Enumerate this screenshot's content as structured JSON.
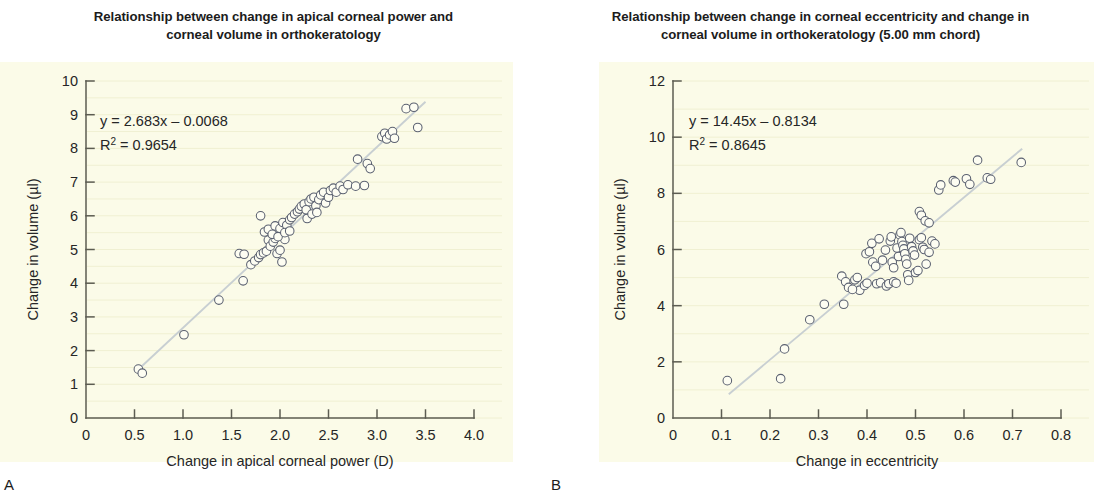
{
  "figure": {
    "panels": [
      {
        "letter": "A",
        "title_line1": "Relationship between change in apical corneal power and",
        "title_line2": "corneal volume in orthokeratology",
        "equation": "y = 2.683x – 0.0068",
        "r2_prefix": "R",
        "r2_sup": "2",
        "r2_value": " = 0.9654"
      },
      {
        "letter": "B",
        "title_line1": "Relationship between change in corneal eccentricity and change in",
        "title_line2": "corneal volume in orthokeratology (5.00 mm chord)",
        "equation": "y = 14.45x – 0.8134",
        "r2_prefix": "R",
        "r2_sup": "2",
        "r2_value": " = 0.8645"
      }
    ],
    "colors": {
      "panel_background": "#fbfbe8",
      "page_background": "#ffffff",
      "marker_stroke": "#5a6070",
      "marker_fill": "#fdfdf2",
      "trendline": "#c8cfd2",
      "axis": "#5c5c52",
      "gridline": "#f0f0d2",
      "text": "#262626"
    }
  },
  "chart_data": [
    {
      "type": "scatter",
      "panel": "A",
      "title": "Relationship between change in apical corneal power and corneal volume in orthokeratology",
      "xlabel": "Change in apical corneal power (D)",
      "ylabel": "Change in volume (µl)",
      "xlim": [
        0,
        4.0
      ],
      "ylim": [
        0,
        10
      ],
      "xticks": [
        "0",
        "0.5",
        "1.0",
        "1.5",
        "2.0",
        "2.5",
        "3.0",
        "3.5",
        "4.0"
      ],
      "xtick_values": [
        0,
        0.5,
        1.0,
        1.5,
        2.0,
        2.5,
        3.0,
        3.5,
        4.0
      ],
      "yticks": [
        "0",
        "1",
        "2",
        "3",
        "4",
        "5",
        "6",
        "7",
        "8",
        "9",
        "10"
      ],
      "ytick_values": [
        0,
        1,
        2,
        3,
        4,
        5,
        6,
        7,
        8,
        9,
        10
      ],
      "grid": true,
      "legend": "none",
      "annotations": [
        "y = 2.683x – 0.0068",
        "R2 = 0.9654"
      ],
      "fit": {
        "slope": 2.683,
        "intercept": -0.0068,
        "r_squared": 0.9654
      },
      "fit_line_x_range": [
        0.52,
        3.5
      ],
      "points": [
        [
          0.54,
          1.45
        ],
        [
          0.58,
          1.33
        ],
        [
          1.01,
          2.47
        ],
        [
          1.37,
          3.5
        ],
        [
          1.62,
          4.07
        ],
        [
          1.58,
          4.88
        ],
        [
          1.63,
          4.86
        ],
        [
          1.7,
          4.55
        ],
        [
          1.74,
          4.66
        ],
        [
          1.78,
          4.76
        ],
        [
          1.8,
          4.85
        ],
        [
          1.83,
          4.9
        ],
        [
          1.86,
          4.95
        ],
        [
          1.88,
          5.28
        ],
        [
          1.9,
          5.1
        ],
        [
          1.93,
          5.22
        ],
        [
          1.95,
          5.33
        ],
        [
          1.97,
          4.88
        ],
        [
          2.0,
          4.98
        ],
        [
          2.02,
          4.63
        ],
        [
          2.05,
          5.3
        ],
        [
          1.84,
          5.52
        ],
        [
          1.88,
          5.6
        ],
        [
          1.95,
          5.7
        ],
        [
          2.0,
          5.62
        ],
        [
          2.03,
          5.8
        ],
        [
          2.07,
          5.72
        ],
        [
          2.1,
          5.88
        ],
        [
          2.12,
          5.95
        ],
        [
          1.92,
          5.45
        ],
        [
          1.98,
          5.38
        ],
        [
          2.05,
          5.5
        ],
        [
          2.1,
          5.55
        ],
        [
          1.8,
          6.0
        ],
        [
          2.15,
          6.05
        ],
        [
          2.18,
          6.12
        ],
        [
          2.2,
          6.2
        ],
        [
          2.22,
          6.28
        ],
        [
          2.25,
          6.35
        ],
        [
          2.27,
          6.18
        ],
        [
          2.3,
          6.42
        ],
        [
          2.32,
          6.5
        ],
        [
          2.35,
          6.55
        ],
        [
          2.37,
          6.3
        ],
        [
          2.4,
          6.48
        ],
        [
          2.42,
          6.62
        ],
        [
          2.45,
          6.7
        ],
        [
          2.28,
          5.92
        ],
        [
          2.33,
          6.05
        ],
        [
          2.38,
          6.1
        ],
        [
          2.47,
          6.38
        ],
        [
          2.5,
          6.55
        ],
        [
          2.52,
          6.75
        ],
        [
          2.55,
          6.82
        ],
        [
          2.58,
          6.7
        ],
        [
          2.62,
          6.88
        ],
        [
          2.65,
          6.78
        ],
        [
          2.7,
          6.92
        ],
        [
          2.78,
          6.88
        ],
        [
          2.87,
          6.9
        ],
        [
          2.8,
          7.68
        ],
        [
          2.9,
          7.55
        ],
        [
          2.93,
          7.4
        ],
        [
          3.05,
          8.35
        ],
        [
          3.08,
          8.45
        ],
        [
          3.1,
          8.28
        ],
        [
          3.13,
          8.4
        ],
        [
          3.16,
          8.5
        ],
        [
          3.18,
          8.3
        ],
        [
          3.3,
          9.18
        ],
        [
          3.38,
          9.22
        ],
        [
          3.42,
          8.62
        ]
      ]
    },
    {
      "type": "scatter",
      "panel": "B",
      "title": "Relationship between change in corneal eccentricity and change in corneal volume in orthokeratology (5.00 mm chord)",
      "xlabel": "Change in eccentricity",
      "ylabel": "Change in volume (µl)",
      "xlim": [
        0,
        0.8
      ],
      "ylim": [
        0,
        12
      ],
      "xticks": [
        "0",
        "0.1",
        "0.2",
        "0.3",
        "0.4",
        "0.5",
        "0.6",
        "0.7",
        "0.8"
      ],
      "xtick_values": [
        0,
        0.1,
        0.2,
        0.3,
        0.4,
        0.5,
        0.6,
        0.7,
        0.8
      ],
      "yticks": [
        "0",
        "2",
        "4",
        "6",
        "8",
        "10",
        "12"
      ],
      "ytick_values": [
        0,
        2,
        4,
        6,
        8,
        10,
        12
      ],
      "grid": true,
      "legend": "none",
      "annotations": [
        "y = 14.45x – 0.8134",
        "R2 = 0.8645"
      ],
      "fit": {
        "slope": 14.45,
        "intercept": -0.8134,
        "r_squared": 0.8645
      },
      "fit_line_x_range": [
        0.115,
        0.72
      ],
      "points": [
        [
          0.112,
          1.33
        ],
        [
          0.222,
          1.4
        ],
        [
          0.23,
          2.46
        ],
        [
          0.282,
          3.5
        ],
        [
          0.312,
          4.05
        ],
        [
          0.352,
          4.05
        ],
        [
          0.375,
          4.92
        ],
        [
          0.38,
          5.0
        ],
        [
          0.385,
          4.55
        ],
        [
          0.395,
          4.72
        ],
        [
          0.4,
          4.8
        ],
        [
          0.398,
          5.85
        ],
        [
          0.405,
          5.92
        ],
        [
          0.412,
          5.55
        ],
        [
          0.418,
          5.4
        ],
        [
          0.42,
          4.78
        ],
        [
          0.428,
          4.82
        ],
        [
          0.432,
          5.62
        ],
        [
          0.438,
          5.98
        ],
        [
          0.44,
          4.7
        ],
        [
          0.445,
          4.78
        ],
        [
          0.448,
          6.3
        ],
        [
          0.45,
          6.45
        ],
        [
          0.452,
          5.55
        ],
        [
          0.455,
          5.35
        ],
        [
          0.455,
          4.85
        ],
        [
          0.46,
          4.8
        ],
        [
          0.462,
          6.05
        ],
        [
          0.465,
          5.75
        ],
        [
          0.468,
          6.52
        ],
        [
          0.47,
          6.6
        ],
        [
          0.472,
          6.28
        ],
        [
          0.474,
          6.15
        ],
        [
          0.476,
          6.02
        ],
        [
          0.478,
          5.85
        ],
        [
          0.48,
          5.65
        ],
        [
          0.482,
          5.48
        ],
        [
          0.484,
          5.1
        ],
        [
          0.486,
          4.9
        ],
        [
          0.488,
          6.4
        ],
        [
          0.492,
          6.1
        ],
        [
          0.495,
          5.95
        ],
        [
          0.498,
          5.8
        ],
        [
          0.5,
          5.18
        ],
        [
          0.505,
          5.25
        ],
        [
          0.508,
          6.35
        ],
        [
          0.512,
          6.42
        ],
        [
          0.515,
          6.08
        ],
        [
          0.518,
          6.0
        ],
        [
          0.522,
          5.48
        ],
        [
          0.528,
          5.9
        ],
        [
          0.534,
          6.3
        ],
        [
          0.54,
          6.2
        ],
        [
          0.348,
          5.05
        ],
        [
          0.356,
          4.85
        ],
        [
          0.362,
          4.65
        ],
        [
          0.37,
          4.58
        ],
        [
          0.41,
          6.22
        ],
        [
          0.425,
          6.38
        ],
        [
          0.508,
          7.35
        ],
        [
          0.512,
          7.22
        ],
        [
          0.52,
          7.02
        ],
        [
          0.528,
          6.95
        ],
        [
          0.548,
          8.12
        ],
        [
          0.552,
          8.3
        ],
        [
          0.578,
          8.45
        ],
        [
          0.582,
          8.4
        ],
        [
          0.605,
          8.52
        ],
        [
          0.612,
          8.32
        ],
        [
          0.628,
          9.18
        ],
        [
          0.648,
          8.55
        ],
        [
          0.655,
          8.5
        ],
        [
          0.718,
          9.1
        ]
      ]
    }
  ]
}
